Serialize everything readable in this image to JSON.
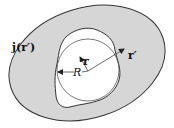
{
  "diagram": {
    "type": "geometric-schematic",
    "colors": {
      "outer_region": "#d6d6d6",
      "inner_region": "#ffffff",
      "stroke": "#333333"
    },
    "labels": {
      "current_density": "j(r′)",
      "source_vector": "r′",
      "field_vector": "r",
      "radius": "R"
    },
    "shapes": [
      {
        "name": "outer-ellipse",
        "fill": "gray",
        "description": "tilted ellipse source region"
      },
      {
        "name": "inner-blob",
        "fill": "white",
        "description": "irregular empty region"
      },
      {
        "name": "sphere-circle",
        "fill": "none",
        "description": "circle of radius R inside blob"
      }
    ],
    "arrows": [
      {
        "name": "r-prime-arrow",
        "label": "r′",
        "from": "center",
        "to": "upper-right"
      },
      {
        "name": "r-arrow",
        "label": "r",
        "from": "center",
        "to": "upper-left short"
      },
      {
        "name": "radius-arrow",
        "label": "R",
        "from": "center",
        "to": "left circle edge"
      }
    ]
  }
}
